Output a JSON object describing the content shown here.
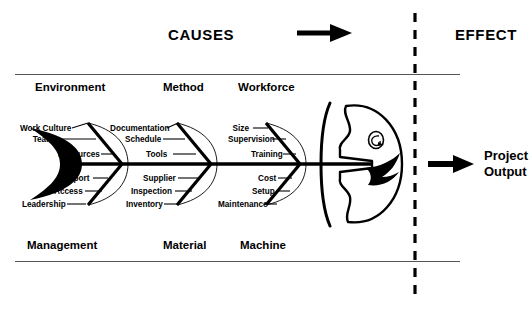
{
  "diagram": {
    "type": "fishbone-ishikawa",
    "header": {
      "causes_label": "CAUSES",
      "effect_label": "EFFECT",
      "flow_arrow_icon": "arrow-right-icon"
    },
    "effect": {
      "line1": "Project",
      "line2": "Output",
      "arrow_icon": "arrow-right-icon"
    },
    "divider": {
      "style": "dashed-vertical",
      "color": "#000000"
    },
    "spine": {
      "color": "#000000",
      "tail_icon": "fish-tail-icon",
      "head_icon": "fish-head-icon",
      "eye_icon": "fish-eye-icon",
      "gill_icon": "fish-gill-icon",
      "mouth_icon": "fish-mouth-icon"
    },
    "categories_top": [
      {
        "name": "Environment",
        "causes": [
          "Work Culture",
          "Teams",
          "Resources"
        ]
      },
      {
        "name": "Method",
        "causes": [
          "Documentation",
          "Schedule",
          "Tools"
        ]
      },
      {
        "name": "Workforce",
        "causes": [
          "Size",
          "Supervision",
          "Training"
        ]
      }
    ],
    "categories_bottom": [
      {
        "name": "Management",
        "causes": [
          "Support",
          "Access",
          "Leadership"
        ]
      },
      {
        "name": "Material",
        "causes": [
          "Supplier",
          "Inspection",
          "Inventory"
        ]
      },
      {
        "name": "Machine",
        "causes": [
          "Cost",
          "Setup",
          "Maintenance"
        ]
      }
    ],
    "colors": {
      "ink": "#000000",
      "rule": "#555555",
      "background": "#ffffff"
    }
  }
}
